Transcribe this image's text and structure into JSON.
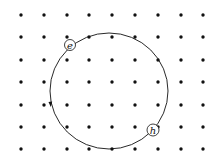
{
  "diagram": {
    "colors": {
      "background": "#ffffff",
      "ink": "#111111"
    },
    "field_grid": {
      "symbol": "dot",
      "columns_x": [
        21,
        44,
        67,
        89,
        112,
        135,
        158,
        181,
        203
      ],
      "rows_y": [
        15,
        37,
        60,
        82,
        105,
        127,
        149
      ],
      "dot_radius": 1.7
    },
    "orbit": {
      "cx": 109,
      "cy": 91,
      "rx": 59,
      "ry": 58
    },
    "particles": [
      {
        "label": "e",
        "cx": 70,
        "cy": 45,
        "r": 5.5
      },
      {
        "label": "h",
        "cx": 153,
        "cy": 130,
        "r": 6
      }
    ]
  }
}
